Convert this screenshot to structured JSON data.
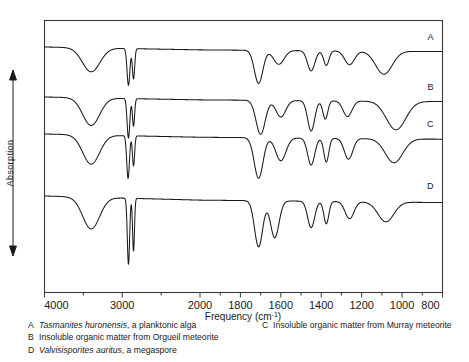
{
  "figure": {
    "y_axis_label": "Absorption",
    "x_axis_title": "Frequency (cm",
    "x_axis_title_sup": "-1",
    "x_axis_title_end": ")",
    "x_ticks": [
      "4000",
      "3000",
      "2000",
      "1800",
      "1600",
      "1400",
      "1200",
      "1000",
      "800"
    ],
    "trace_labels": [
      "A",
      "B",
      "C",
      "D"
    ]
  },
  "caption": {
    "left": [
      {
        "key": "A",
        "italic": "Tasmanites huronensis",
        "rest": ", a planktonic alga"
      },
      {
        "key": "B",
        "italic": "",
        "rest": "Insoluble organic matter from Orgueil meteorite"
      },
      {
        "key": "D",
        "italic": "Valvisisporites auritus",
        "rest": ", a megaspore"
      }
    ],
    "right": [
      {
        "key": "C",
        "italic": "",
        "rest": "Insoluble organic matter from Murray meteorite"
      }
    ]
  },
  "chart_data": {
    "type": "line",
    "title": "",
    "xlabel": "Frequency (cm-1)",
    "ylabel": "Absorption",
    "xlim": [
      4000,
      800
    ],
    "x_reversed": true,
    "axis_scale": "piecewise: 4000-2000 compressed, 2000-800 expanded",
    "grid": false,
    "legend": "inline right-edge trace letters",
    "series": [
      {
        "name": "A",
        "label": "Tasmanites huronensis, a planktonic alga",
        "baseline_level": 0.12,
        "bands": [
          {
            "center": 3400,
            "depth": 0.52,
            "width": 260,
            "shape": "broad",
            "assignment": "O-H stretch"
          },
          {
            "center": 2920,
            "depth": 0.8,
            "width": 42,
            "shape": "sharp",
            "assignment": "C-H asym stretch"
          },
          {
            "center": 2855,
            "depth": 0.66,
            "width": 34,
            "shape": "sharp",
            "assignment": "C-H sym stretch"
          },
          {
            "center": 1710,
            "depth": 0.72,
            "width": 48,
            "shape": "sharp",
            "assignment": "C=O stretch"
          },
          {
            "center": 1610,
            "depth": 0.3,
            "width": 60,
            "shape": "medium",
            "assignment": "C=C aromatic"
          },
          {
            "center": 1450,
            "depth": 0.44,
            "width": 42,
            "shape": "medium",
            "assignment": "CH2 bend"
          },
          {
            "center": 1375,
            "depth": 0.32,
            "width": 30,
            "shape": "medium",
            "assignment": "CH3 bend"
          },
          {
            "center": 1260,
            "depth": 0.3,
            "width": 55,
            "shape": "medium",
            "assignment": "C-O stretch"
          },
          {
            "center": 1090,
            "depth": 0.5,
            "width": 95,
            "shape": "broad",
            "assignment": "C-O / silicate"
          }
        ]
      },
      {
        "name": "B",
        "label": "Insoluble organic matter from Orgueil meteorite",
        "baseline_level": 0.12,
        "bands": [
          {
            "center": 3400,
            "depth": 0.6,
            "width": 250,
            "shape": "broad",
            "assignment": "O-H stretch"
          },
          {
            "center": 2920,
            "depth": 0.86,
            "width": 40,
            "shape": "sharp",
            "assignment": "C-H asym stretch"
          },
          {
            "center": 2855,
            "depth": 0.6,
            "width": 32,
            "shape": "sharp",
            "assignment": "C-H sym stretch"
          },
          {
            "center": 1700,
            "depth": 0.74,
            "width": 52,
            "shape": "sharp",
            "assignment": "C=O stretch"
          },
          {
            "center": 1600,
            "depth": 0.36,
            "width": 55,
            "shape": "medium",
            "assignment": "C=C aromatic"
          },
          {
            "center": 1450,
            "depth": 0.66,
            "width": 40,
            "shape": "medium",
            "assignment": "CH2 bend"
          },
          {
            "center": 1380,
            "depth": 0.4,
            "width": 28,
            "shape": "medium",
            "assignment": "CH3 bend"
          },
          {
            "center": 1270,
            "depth": 0.34,
            "width": 50,
            "shape": "medium",
            "assignment": "C-O stretch"
          },
          {
            "center": 1030,
            "depth": 0.62,
            "width": 110,
            "shape": "broad",
            "assignment": "Si-O / C-O"
          }
        ]
      },
      {
        "name": "C",
        "label": "Insoluble organic matter from Murray meteorite",
        "baseline_level": 0.12,
        "bands": [
          {
            "center": 3400,
            "depth": 0.56,
            "width": 250,
            "shape": "broad",
            "assignment": "O-H stretch"
          },
          {
            "center": 2925,
            "depth": 0.82,
            "width": 40,
            "shape": "sharp",
            "assignment": "C-H asym stretch"
          },
          {
            "center": 2855,
            "depth": 0.58,
            "width": 32,
            "shape": "sharp",
            "assignment": "C-H sym stretch"
          },
          {
            "center": 1710,
            "depth": 0.78,
            "width": 50,
            "shape": "sharp",
            "assignment": "C=O stretch"
          },
          {
            "center": 1600,
            "depth": 0.44,
            "width": 58,
            "shape": "medium",
            "assignment": "C=C aromatic"
          },
          {
            "center": 1450,
            "depth": 0.52,
            "width": 40,
            "shape": "medium",
            "assignment": "CH2 bend"
          },
          {
            "center": 1375,
            "depth": 0.46,
            "width": 28,
            "shape": "medium",
            "assignment": "CH3 bend"
          },
          {
            "center": 1265,
            "depth": 0.4,
            "width": 48,
            "shape": "medium",
            "assignment": "C-O stretch"
          },
          {
            "center": 1040,
            "depth": 0.46,
            "width": 100,
            "shape": "broad",
            "assignment": "Si-O / C-O"
          }
        ]
      },
      {
        "name": "D",
        "label": "Valvisisporites auritus, a megaspore",
        "baseline_level": 0.12,
        "bands": [
          {
            "center": 3400,
            "depth": 0.48,
            "width": 250,
            "shape": "broad",
            "assignment": "O-H stretch"
          },
          {
            "center": 2920,
            "depth": 1.0,
            "width": 34,
            "shape": "very-sharp",
            "assignment": "C-H asym stretch"
          },
          {
            "center": 2855,
            "depth": 0.8,
            "width": 28,
            "shape": "sharp",
            "assignment": "C-H sym stretch"
          },
          {
            "center": 1710,
            "depth": 0.7,
            "width": 46,
            "shape": "sharp",
            "assignment": "C=O stretch"
          },
          {
            "center": 1630,
            "depth": 0.56,
            "width": 48,
            "shape": "medium",
            "assignment": "C=C aromatic"
          },
          {
            "center": 1450,
            "depth": 0.4,
            "width": 40,
            "shape": "medium",
            "assignment": "CH2 bend"
          },
          {
            "center": 1375,
            "depth": 0.34,
            "width": 28,
            "shape": "medium",
            "assignment": "CH3 bend"
          },
          {
            "center": 1260,
            "depth": 0.26,
            "width": 50,
            "shape": "medium",
            "assignment": "C-O stretch"
          },
          {
            "center": 1080,
            "depth": 0.3,
            "width": 90,
            "shape": "broad",
            "assignment": "C-O stretch"
          }
        ]
      }
    ]
  }
}
